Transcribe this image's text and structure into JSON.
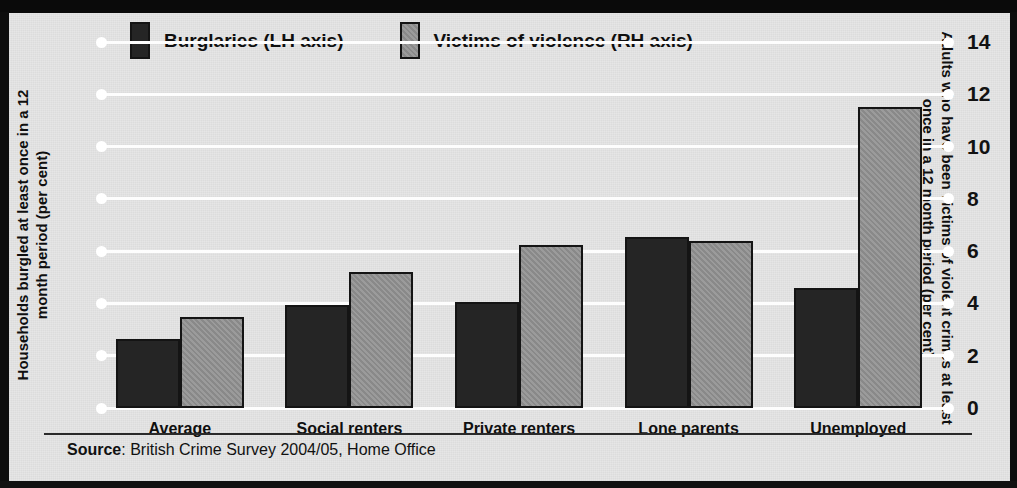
{
  "chart_data": {
    "type": "bar",
    "title": "",
    "subtitle": "",
    "categories": [
      "Average",
      "Social renters",
      "Private renters",
      "Lone parents",
      "Unemployed"
    ],
    "series": [
      {
        "name": "Burglaries (LH axis)",
        "axis": "left",
        "color": "#252525",
        "values": [
          2.65,
          3.95,
          4.05,
          6.55,
          4.6
        ]
      },
      {
        "name": "Victims of violence (RH axis)",
        "axis": "right",
        "color": "#909090",
        "values": [
          3.5,
          5.2,
          6.25,
          6.4,
          11.5
        ]
      }
    ],
    "xlabel": "",
    "ylabel": "Households burgled at least once in a 12 month period (per cent)",
    "y2label": "Adults who have been victims of violent crimes at least once in a 12 month period (per cent)",
    "ylim": [
      0,
      14
    ],
    "y2lim": [
      0,
      14
    ],
    "yticks": [
      0,
      2,
      4,
      6,
      8,
      10,
      12,
      14
    ],
    "y2ticks": [
      0,
      2,
      4,
      6,
      8,
      10,
      12,
      14
    ],
    "ytick_labels": [
      "0",
      "2",
      "4",
      "6",
      "8",
      "10",
      "12",
      "14"
    ],
    "y2tick_labels": [
      "0",
      "2",
      "4",
      "6",
      "8",
      "10",
      "12",
      "14"
    ],
    "grid": true,
    "grid_axis": "y",
    "legend_position": "top-left",
    "source": "British Crime Survey 2004/05, Home Office"
  },
  "axes": {
    "left_title": "Households burgled at least once in a 12 month period (per cent)",
    "right_title": "Adults who have been victims of violent crimes at least once in a 12 month period (per cent)"
  },
  "legend": {
    "items": [
      {
        "label": "Burglaries (LH axis)",
        "swatch": "dark"
      },
      {
        "label": "Victims of violence (RH axis)",
        "swatch": "grey"
      }
    ]
  },
  "source": {
    "prefix": "Source",
    "separator": ": ",
    "text": "British Crime Survey 2004/05, Home Office"
  },
  "colors": {
    "series_burglaries": "#252525",
    "series_violence": "#909090",
    "background": "#e6e6e6",
    "frame": "#0d0d0d",
    "gridline": "#fdfdfd",
    "text": "#111111"
  }
}
